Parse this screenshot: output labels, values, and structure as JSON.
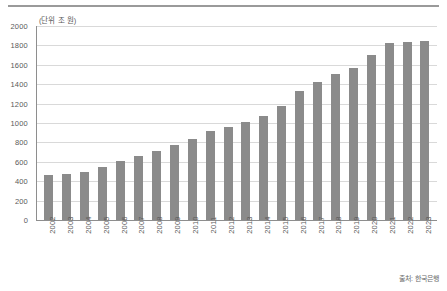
{
  "chart_data": {
    "type": "bar",
    "title": "",
    "subtitle": "",
    "unit_label": "(단위 조 원)",
    "xlabel": "",
    "ylabel": "",
    "ylim": [
      0,
      2000
    ],
    "yticks": [
      2000,
      1800,
      1600,
      1400,
      1200,
      1000,
      800,
      600,
      400,
      200,
      0
    ],
    "grid": true,
    "legend": "none",
    "bar_color": "#8b8b8b",
    "categories": [
      "2002",
      "2003",
      "2004",
      "2005",
      "2006",
      "2007",
      "2008",
      "2009",
      "2010",
      "2011",
      "2012",
      "2013",
      "2014",
      "2015",
      "2016",
      "2017",
      "2018",
      "2019",
      "2020",
      "2021",
      "2022",
      "2023"
    ],
    "values": [
      465,
      475,
      495,
      542,
      610,
      660,
      710,
      770,
      835,
      916,
      964,
      1010,
      1070,
      1180,
      1325,
      1420,
      1505,
      1570,
      1700,
      1830,
      1835,
      1850
    ],
    "source": "출처: 한국은행"
  }
}
